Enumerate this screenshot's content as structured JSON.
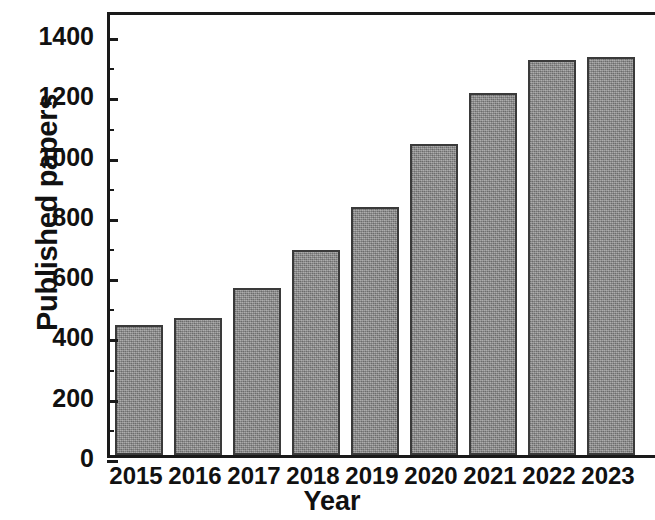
{
  "chart_data": {
    "type": "bar",
    "title": "",
    "xlabel": "Year",
    "ylabel": "Published papers",
    "categories": [
      "2015",
      "2016",
      "2017",
      "2018",
      "2019",
      "2020",
      "2021",
      "2022",
      "2023"
    ],
    "values": [
      431,
      455,
      555,
      680,
      822,
      1033,
      1202,
      1312,
      1320
    ],
    "ylim": [
      0,
      1480
    ],
    "xlim_note": "categorical",
    "y_major_ticks": [
      0,
      200,
      400,
      600,
      800,
      1000,
      1200,
      1400
    ],
    "y_tick_labels": [
      "0",
      "200",
      "400",
      "600",
      "800",
      "1000",
      "1200",
      "1400"
    ],
    "y_minor_ticks": [
      100,
      300,
      500,
      700,
      900,
      1100,
      1300
    ],
    "grid": "horizontal-major-only",
    "legend": "none",
    "series": [
      {
        "name": "Published papers",
        "values": [
          431,
          455,
          555,
          680,
          822,
          1033,
          1202,
          1312,
          1320
        ]
      }
    ],
    "colors": {
      "bar_fill": "#8a8a8a",
      "bar_edge": "#3a3a3a",
      "axis": "#1a1a1a",
      "grid": "#d8d8d8",
      "text": "#111111",
      "background": "#ffffff"
    }
  }
}
